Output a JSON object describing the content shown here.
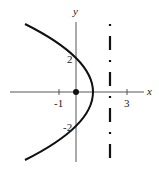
{
  "diagram": {
    "title": "",
    "axes": {
      "x_label": "x",
      "y_label": "y",
      "x_ticks": [
        {
          "value": -1,
          "label": "-1"
        },
        {
          "value": 3,
          "label": "3"
        }
      ],
      "y_ticks": [
        {
          "value": 2,
          "label": "2"
        },
        {
          "value": -2,
          "label": "-2"
        }
      ],
      "x_range": [
        -3.9,
        4.1
      ],
      "y_range": [
        -4.1,
        4.1
      ]
    },
    "curve": {
      "type": "parabola",
      "equation": "y^2 = 4(1 - x)",
      "vertex": [
        1,
        0
      ],
      "opens": "left",
      "y_intercepts": [
        2,
        -2
      ]
    },
    "focus": {
      "x": 0,
      "y": 0,
      "style": "filled-dot"
    },
    "directrix": {
      "x": 2,
      "style": "dashed"
    },
    "colors": {
      "stroke": "#111111",
      "axis": "#555555",
      "background": "#ffffff"
    }
  },
  "labels": {
    "x_axis": "x",
    "y_axis": "y",
    "tick_neg1": "-1",
    "tick_3": "3",
    "tick_2": "2",
    "tick_neg2": "-2"
  }
}
